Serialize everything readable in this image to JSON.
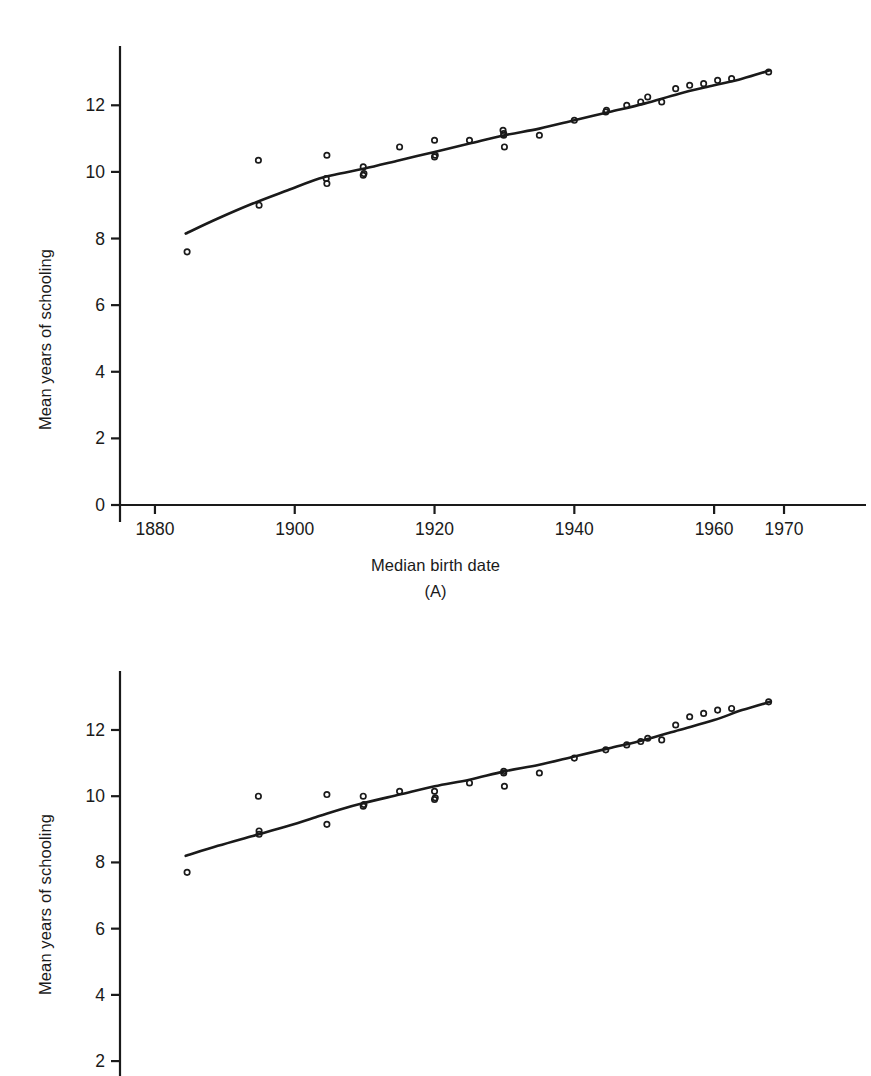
{
  "page": {
    "background": "#ffffff",
    "ink": "#1a1a1a",
    "top_cut_text": ""
  },
  "chart_data": [
    {
      "id": "A",
      "type": "scatter",
      "title": "",
      "caption": "(A)",
      "xlabel": "Median birth date",
      "ylabel": "Mean years of schooling",
      "xlim": [
        1875,
        1972
      ],
      "ylim": [
        0,
        13.6
      ],
      "xticks": [
        1880,
        1900,
        1920,
        1940,
        1960,
        1970
      ],
      "xticklabels": [
        "1880",
        "1900",
        "1920",
        "1940",
        "1960",
        "1970"
      ],
      "yticks": [
        0,
        2,
        4,
        6,
        8,
        10,
        12
      ],
      "yticklabels": [
        "0",
        "2",
        "4",
        "6",
        "8",
        "10",
        "12"
      ],
      "grid": false,
      "legend": "none",
      "marker": "open-circle",
      "series": [
        {
          "name": "observed",
          "points": [
            [
              1884.6,
              7.6
            ],
            [
              1894.8,
              10.35
            ],
            [
              1894.9,
              9.0
            ],
            [
              1904.6,
              10.5
            ],
            [
              1904.5,
              9.8
            ],
            [
              1904.6,
              9.65
            ],
            [
              1909.8,
              10.15
            ],
            [
              1909.9,
              9.95
            ],
            [
              1909.8,
              9.9
            ],
            [
              1915.0,
              10.75
            ],
            [
              1920.0,
              10.95
            ],
            [
              1920.1,
              10.5
            ],
            [
              1920.0,
              10.45
            ],
            [
              1925.0,
              10.95
            ],
            [
              1929.8,
              11.25
            ],
            [
              1929.9,
              11.1
            ],
            [
              1929.9,
              11.15
            ],
            [
              1930.0,
              10.75
            ],
            [
              1935.0,
              11.1
            ],
            [
              1940.0,
              11.55
            ],
            [
              1944.5,
              11.8
            ],
            [
              1944.6,
              11.85
            ],
            [
              1947.5,
              12.0
            ],
            [
              1949.5,
              12.1
            ],
            [
              1950.5,
              12.25
            ],
            [
              1952.5,
              12.1
            ],
            [
              1954.5,
              12.5
            ],
            [
              1956.5,
              12.6
            ],
            [
              1958.5,
              12.65
            ],
            [
              1960.5,
              12.75
            ],
            [
              1962.5,
              12.8
            ],
            [
              1967.8,
              13.0
            ]
          ]
        },
        {
          "name": "fitted-curve",
          "line": [
            [
              1884.4,
              8.15
            ],
            [
              1889.0,
              8.6
            ],
            [
              1894.0,
              9.05
            ],
            [
              1899.0,
              9.45
            ],
            [
              1903.5,
              9.8
            ],
            [
              1906.5,
              9.95
            ],
            [
              1910.0,
              10.1
            ],
            [
              1915.0,
              10.35
            ],
            [
              1920.0,
              10.6
            ],
            [
              1925.0,
              10.85
            ],
            [
              1930.0,
              11.1
            ],
            [
              1935.0,
              11.3
            ],
            [
              1940.0,
              11.55
            ],
            [
              1945.0,
              11.8
            ],
            [
              1950.0,
              12.05
            ],
            [
              1955.0,
              12.35
            ],
            [
              1960.0,
              12.6
            ],
            [
              1964.0,
              12.8
            ],
            [
              1968.0,
              13.05
            ]
          ]
        }
      ]
    },
    {
      "id": "B",
      "type": "scatter",
      "title": "",
      "caption": "",
      "xlabel": "",
      "ylabel": "Mean years of schooling",
      "xlim": [
        1875,
        1972
      ],
      "ylim": [
        1.55,
        13.6
      ],
      "xticks": [],
      "xticklabels": [],
      "yticks": [
        2,
        4,
        6,
        8,
        10,
        12
      ],
      "yticklabels": [
        "2",
        "4",
        "6",
        "8",
        "10",
        "12"
      ],
      "grid": false,
      "legend": "none",
      "marker": "open-circle",
      "series": [
        {
          "name": "observed",
          "points": [
            [
              1884.6,
              7.7
            ],
            [
              1894.8,
              10.0
            ],
            [
              1894.9,
              8.95
            ],
            [
              1894.9,
              8.85
            ],
            [
              1904.6,
              10.05
            ],
            [
              1904.6,
              9.15
            ],
            [
              1909.8,
              10.0
            ],
            [
              1909.9,
              9.75
            ],
            [
              1909.8,
              9.7
            ],
            [
              1915.0,
              10.15
            ],
            [
              1920.0,
              10.15
            ],
            [
              1920.1,
              9.95
            ],
            [
              1920.0,
              9.9
            ],
            [
              1925.0,
              10.4
            ],
            [
              1929.9,
              10.75
            ],
            [
              1929.9,
              10.7
            ],
            [
              1930.0,
              10.3
            ],
            [
              1935.0,
              10.7
            ],
            [
              1940.0,
              11.15
            ],
            [
              1944.5,
              11.4
            ],
            [
              1947.5,
              11.55
            ],
            [
              1949.5,
              11.65
            ],
            [
              1950.5,
              11.75
            ],
            [
              1952.5,
              11.7
            ],
            [
              1954.5,
              12.15
            ],
            [
              1956.5,
              12.4
            ],
            [
              1958.5,
              12.5
            ],
            [
              1960.5,
              12.6
            ],
            [
              1962.5,
              12.65
            ],
            [
              1967.8,
              12.85
            ]
          ]
        },
        {
          "name": "fitted-curve",
          "line": [
            [
              1884.4,
              8.2
            ],
            [
              1889.0,
              8.5
            ],
            [
              1894.0,
              8.8
            ],
            [
              1899.0,
              9.1
            ],
            [
              1903.5,
              9.4
            ],
            [
              1906.5,
              9.6
            ],
            [
              1910.0,
              9.8
            ],
            [
              1915.0,
              10.05
            ],
            [
              1920.0,
              10.3
            ],
            [
              1925.0,
              10.5
            ],
            [
              1930.0,
              10.75
            ],
            [
              1935.0,
              10.95
            ],
            [
              1940.0,
              11.2
            ],
            [
              1945.0,
              11.45
            ],
            [
              1950.0,
              11.7
            ],
            [
              1955.0,
              12.0
            ],
            [
              1960.0,
              12.3
            ],
            [
              1964.0,
              12.6
            ],
            [
              1968.0,
              12.85
            ]
          ]
        }
      ]
    }
  ]
}
